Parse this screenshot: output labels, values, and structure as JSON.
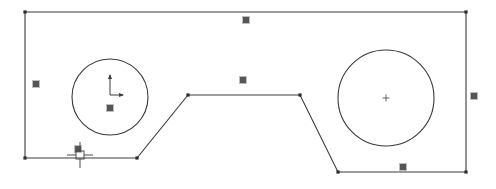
{
  "document": {
    "title": "CAD Sketch View",
    "background_color": "#ffffff",
    "width": 496,
    "height": 189
  },
  "style": {
    "geometry_color": "#3a3a3a",
    "geometry_stroke_width": 1.1,
    "grip_fill": "#555555",
    "grip_stroke": "#bdbdbd",
    "grip_size": 7,
    "vertex_marker_color": "#2b2b2b",
    "vertex_marker_size": 3,
    "cursor_color": "#4a4a4a",
    "axis_icon_color": "#3a3a3a",
    "center_mark_color": "#555555"
  },
  "drawing": {
    "name": "plate-with-bottom-notch-and-two-holes",
    "outline": {
      "name": "outer-profile",
      "closed": true,
      "points": [
        [
          25,
          12
        ],
        [
          466,
          12
        ],
        [
          466,
          172
        ],
        [
          338,
          172
        ],
        [
          300,
          95
        ],
        [
          188,
          95
        ],
        [
          137,
          158
        ],
        [
          25,
          158
        ]
      ]
    },
    "circles": [
      {
        "name": "left-hole",
        "cx": 110,
        "cy": 97,
        "r": 38,
        "center_mark": "axis-icon"
      },
      {
        "name": "right-hole",
        "cx": 386,
        "cy": 98,
        "r": 48,
        "center_mark": "cross"
      }
    ],
    "vertex_markers": [
      [
        25,
        12
      ],
      [
        466,
        12
      ],
      [
        466,
        172
      ],
      [
        338,
        172
      ],
      [
        300,
        95
      ],
      [
        188,
        95
      ],
      [
        137,
        158
      ],
      [
        25,
        158
      ]
    ],
    "grips": [
      {
        "name": "grip-top-edge-midpoint",
        "x": 246,
        "y": 20
      },
      {
        "name": "grip-left-edge-midpoint",
        "x": 36,
        "y": 84
      },
      {
        "name": "grip-right-edge-midpoint",
        "x": 474,
        "y": 96
      },
      {
        "name": "grip-notch-top-edge-midpoint",
        "x": 243,
        "y": 80
      },
      {
        "name": "grip-bottom-left-edge-midpoint",
        "x": 78,
        "y": 149
      },
      {
        "name": "grip-bottom-right-edge-midpoint",
        "x": 403,
        "y": 167
      },
      {
        "name": "grip-left-hole-center",
        "x": 110,
        "y": 108
      }
    ],
    "axis_icon": {
      "name": "ucs-axis-indicator",
      "origin_x": 110,
      "origin_y": 95,
      "y_axis_length": 20,
      "x_axis_length": 13
    },
    "cursor": {
      "name": "crosshair-pickbox-cursor",
      "x": 80,
      "y": 155,
      "pickbox_size": 8,
      "crosshair_length": 9
    }
  },
  "chart_data": {
    "type": "table",
    "columns": [
      "entity",
      "type",
      "parameters"
    ],
    "rows": [
      [
        "outer-profile",
        "closed polyline",
        "8 vertices: (25,12) (466,12) (466,172) (338,172) (300,95) (188,95) (137,158) (25,158)"
      ],
      [
        "left-hole",
        "circle",
        "center (110,97) r=38"
      ],
      [
        "right-hole",
        "circle",
        "center (386,98) r=48"
      ],
      [
        "grips",
        "selection handles",
        "7 square grips"
      ],
      [
        "cursor",
        "pickbox crosshair",
        "at (80,155)"
      ]
    ]
  }
}
